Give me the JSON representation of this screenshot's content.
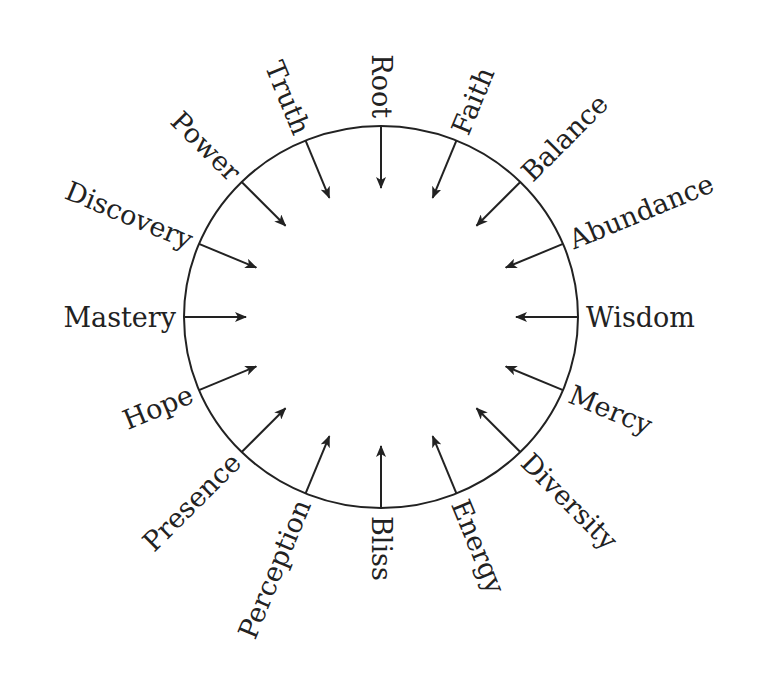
{
  "diagram": {
    "type": "radial-arrow-wheel",
    "center": [
      381,
      317
    ],
    "radius_x": 197,
    "radius_y": 191,
    "stroke_color": "#222222",
    "arrow_direction": "inward",
    "spokes": [
      {
        "label": "Root",
        "angle": -90
      },
      {
        "label": "Faith",
        "angle": -67.5
      },
      {
        "label": "Balance",
        "angle": -45
      },
      {
        "label": "Abundance",
        "angle": -22.5
      },
      {
        "label": "Wisdom",
        "angle": 0
      },
      {
        "label": "Mercy",
        "angle": 22.5
      },
      {
        "label": "Diversity",
        "angle": 45
      },
      {
        "label": "Energy",
        "angle": 67.5
      },
      {
        "label": "Bliss",
        "angle": 90
      },
      {
        "label": "Perception",
        "angle": 112.5
      },
      {
        "label": "Presence",
        "angle": 135
      },
      {
        "label": "Hope",
        "angle": 157.5
      },
      {
        "label": "Mastery",
        "angle": 180
      },
      {
        "label": "Discovery",
        "angle": 202.5
      },
      {
        "label": "Power",
        "angle": 225
      },
      {
        "label": "Truth",
        "angle": 247.5
      }
    ]
  }
}
